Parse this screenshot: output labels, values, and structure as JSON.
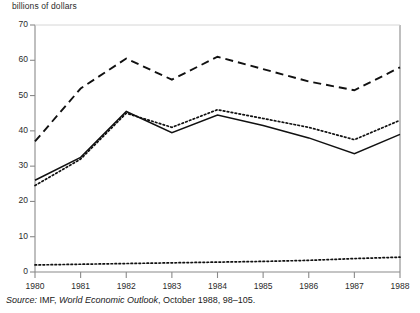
{
  "chart_data": {
    "type": "line",
    "title": "",
    "ylabel": "billions of dollars",
    "xlabel": "",
    "ylim": [
      0,
      70
    ],
    "xlim": [
      1980,
      1988
    ],
    "grid": false,
    "legend": "none",
    "x": [
      1980,
      1981,
      1982,
      1983,
      1984,
      1985,
      1986,
      1987,
      1988
    ],
    "xticklabels": [
      "1980",
      "1981",
      "1982",
      "1983",
      "1984",
      "1985",
      "1986",
      "1987",
      "1988"
    ],
    "yticklabels": [
      "0",
      "10",
      "20",
      "30",
      "40",
      "50",
      "60",
      "70"
    ],
    "yticks": [
      0,
      10,
      20,
      30,
      40,
      50,
      60,
      70
    ],
    "series": [
      {
        "name": "dashed-upper",
        "style": "dashed",
        "values": [
          37.0,
          52.0,
          60.5,
          54.5,
          61.0,
          57.5,
          54.0,
          51.5,
          58.0
        ]
      },
      {
        "name": "dotted-middle",
        "style": "dotted",
        "values": [
          24.5,
          32.0,
          45.0,
          41.0,
          46.0,
          43.5,
          41.0,
          37.5,
          43.0
        ]
      },
      {
        "name": "solid-middle",
        "style": "solid",
        "values": [
          26.0,
          32.5,
          45.5,
          39.5,
          44.5,
          41.5,
          38.0,
          33.5,
          39.0
        ]
      },
      {
        "name": "dotted-lower",
        "style": "dotted",
        "values": [
          2.0,
          2.2,
          2.4,
          2.6,
          2.8,
          3.0,
          3.3,
          3.8,
          4.2
        ]
      }
    ]
  },
  "axis": {
    "y_title": "billions of dollars"
  },
  "source": {
    "label": "Source:",
    "org": "IMF,",
    "publication": "World Economic Outlook",
    "rest": ", October 1988, 98–105."
  }
}
